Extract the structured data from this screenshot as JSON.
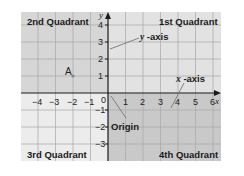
{
  "diagram": {
    "quadrants": {
      "q1": "1st Quadrant",
      "q2": "2nd Quadrant",
      "q3": "3rd Quadrant",
      "q4": "4th Quadrant"
    },
    "axes": {
      "x_name": "x",
      "y_name": "y",
      "x_ticks": [
        "−4",
        "−3",
        "−2",
        "−1",
        "0",
        "1",
        "2",
        "3",
        "4",
        "5",
        "6"
      ],
      "y_ticks_positive": [
        "4",
        "3",
        "2",
        "1"
      ],
      "y_ticks_negative": [
        "−1",
        "−2",
        "−3"
      ],
      "x_range": [
        -5,
        6
      ],
      "y_range": [
        -4,
        4
      ]
    },
    "callouts": {
      "y_axis_var": "y",
      "y_axis_text": " -axis",
      "x_axis_var": "x",
      "x_axis_text": " -axis",
      "origin": "Origin"
    },
    "points": [
      {
        "label": "A",
        "x": -2,
        "y": 1
      }
    ],
    "colors": {
      "q1": "#e2e2e2",
      "q2": "#d6d6d6",
      "q3": "#ececec",
      "q4": "#c9c9c9",
      "axis": "#1a1a1a",
      "grid": "#a8a8a8",
      "pointer": "#777777"
    }
  }
}
